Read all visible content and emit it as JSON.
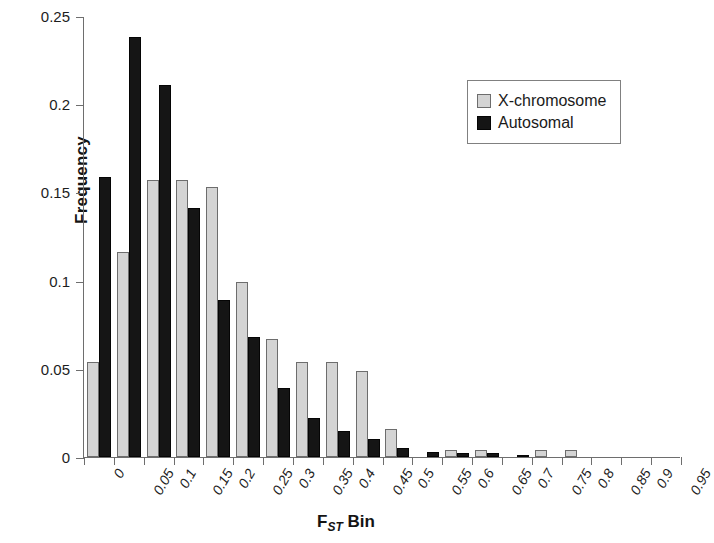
{
  "chart_data": {
    "type": "bar",
    "title": "",
    "xlabel": "FST Bin",
    "xlabel_main": "F",
    "xlabel_sub": "ST",
    "xlabel_tail": " Bin",
    "ylabel": "Frequency",
    "ylim": [
      0,
      0.25
    ],
    "yticks": [
      0,
      0.05,
      0.1,
      0.15,
      0.2,
      0.25
    ],
    "ytick_labels": [
      "0",
      "0.05",
      "0.1",
      "0.15",
      "0.2",
      "0.25"
    ],
    "grid": false,
    "legend_position": "top-right",
    "categories": [
      "0",
      "0.05",
      "0.1",
      "0.15",
      "0.2",
      "0.25",
      "0.3",
      "0.35",
      "0.4",
      "0.45",
      "0.5",
      "0.55",
      "0.6",
      "0.65",
      "0.7",
      "0.75",
      "0.8",
      "0.85",
      "0.9",
      "0.95"
    ],
    "series": [
      {
        "name": "X-chromosome",
        "color": "#d4d4d4",
        "values": [
          0.054,
          0.116,
          0.157,
          0.157,
          0.153,
          0.099,
          0.067,
          0.054,
          0.054,
          0.049,
          0.016,
          0.0,
          0.004,
          0.004,
          0.0,
          0.004,
          0.004,
          0.0,
          0.0,
          0.0
        ]
      },
      {
        "name": "Autosomal",
        "color": "#151515",
        "values": [
          0.159,
          0.238,
          0.211,
          0.141,
          0.089,
          0.068,
          0.039,
          0.022,
          0.015,
          0.01,
          0.005,
          0.003,
          0.002,
          0.002,
          0.001,
          0.0,
          0.0,
          0.0,
          0.0,
          0.0
        ]
      }
    ]
  },
  "legend": {
    "items": [
      {
        "label": "X-chromosome",
        "swatch": "light-gray-square"
      },
      {
        "label": "Autosomal",
        "swatch": "black-square"
      }
    ]
  }
}
